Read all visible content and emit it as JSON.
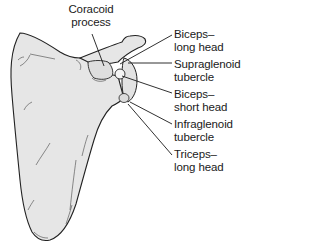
{
  "figure": {
    "colors": {
      "bone_fill": "#e6e6e6",
      "outline": "#222222",
      "leader_line": "#1a1a1a",
      "text": "#1a1a1a",
      "background": "#ffffff"
    }
  },
  "labels": [
    {
      "id": "coracoid-process",
      "line1": "Coracoid",
      "line2": "process"
    },
    {
      "id": "biceps-long-head",
      "line1": "Biceps–",
      "line2": "long head"
    },
    {
      "id": "supraglenoid-tubercle",
      "line1": "Supraglenoid",
      "line2": "tubercle"
    },
    {
      "id": "biceps-short-head",
      "line1": "Biceps–",
      "line2": "short head"
    },
    {
      "id": "infraglenoid-tubercle",
      "line1": "Infraglenoid",
      "line2": "tubercle"
    },
    {
      "id": "triceps-long-head",
      "line1": "Triceps–",
      "line2": "long head"
    }
  ]
}
